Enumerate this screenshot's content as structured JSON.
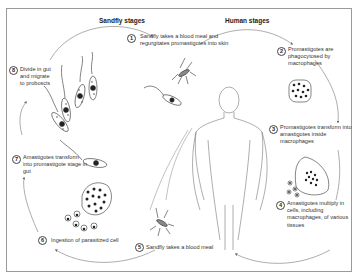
{
  "diagram": {
    "headings": {
      "sandfly": "Sandfly stages",
      "human": "Human stages"
    },
    "steps": [
      {
        "number": "1",
        "text": "Sandfly takes a blood meal and regurgitates promastigotes into skin"
      },
      {
        "number": "2",
        "text": "Promastigotes are phagocytosed by macrophages"
      },
      {
        "number": "3",
        "text": "Promastigotes transform into amastigotes inside macrophages"
      },
      {
        "number": "4",
        "text": "Amastigotes multiply in cells, including macrophages, of various tissues"
      },
      {
        "number": "5",
        "text": "Sandfly takes a blood meal"
      },
      {
        "number": "6",
        "text": "Ingestion of parasitized cell"
      },
      {
        "number": "7",
        "text": "Amastigotes transform into promastigote stage in gut"
      },
      {
        "number": "8",
        "text": "Divide in gut and migrate to proboscis"
      }
    ],
    "illustrations": [
      "sandfly-icon",
      "human-figure-icon",
      "promastigote-icon",
      "macrophage-icon",
      "amastigote-icon",
      "parasitized-cell-icon"
    ],
    "colors": {
      "line": "#8a8a8a",
      "ink": "#222222",
      "frame": "#9a9a9a"
    }
  }
}
